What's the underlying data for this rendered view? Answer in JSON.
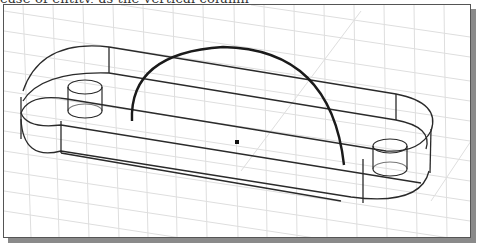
{
  "caption": {
    "text": "ease of entity, as the vertical column"
  },
  "viewport": {
    "border_color": "#555555",
    "shadow_color": "#8a8a8a",
    "background": "#ffffff",
    "grid_color": "#dcdcdc",
    "wire_color": "#2a2a2a",
    "arc_color": "#1a1a1a"
  },
  "model": {
    "description": "Isometric wireframe of a slotted plate with two cylindrical bosses and a construction arc",
    "center_point": {
      "x": 236,
      "y": 141
    },
    "arc": {
      "start": {
        "x": 131,
        "y": 120
      },
      "peak": {
        "x": 222,
        "y": 46
      },
      "end": {
        "x": 343,
        "y": 164
      }
    },
    "bosses": [
      {
        "name": "left-boss",
        "x": 67,
        "y": 80
      },
      {
        "name": "right-boss",
        "x": 372,
        "y": 140
      }
    ]
  }
}
